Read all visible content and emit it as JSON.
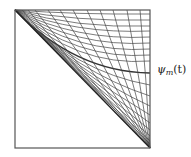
{
  "figure": {
    "type": "curve-family-diagram",
    "frame": {
      "x0": 15,
      "y0": 10,
      "x1": 150,
      "y1": 148
    },
    "colors": {
      "frame": "#555555",
      "curve": "#444444",
      "highlight": "#333333"
    },
    "family_a": {
      "description": "curves from top-left corner to right edge",
      "right_edge_y": [
        14,
        20,
        26,
        31,
        37,
        43,
        49,
        55,
        61,
        73,
        85,
        96,
        106,
        115,
        123,
        130,
        136,
        141,
        144
      ],
      "highlight_index": 9
    },
    "family_b": {
      "description": "curves from bottom-right corner to top edge",
      "top_edge_x": [
        22,
        28,
        35,
        48,
        60,
        73,
        87,
        100,
        113,
        127,
        140
      ]
    }
  },
  "labels": {
    "curve_label": "ψm(t)",
    "curve_label_main": "ψ",
    "curve_label_sub": "m",
    "curve_label_arg": "(t)"
  }
}
